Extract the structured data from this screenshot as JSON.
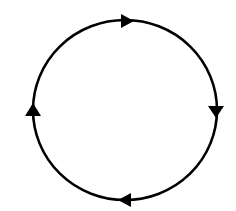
{
  "diagram": {
    "type": "cycle",
    "background": "#ffffff",
    "stroke_color": "#000000",
    "circle": {
      "cx": 125,
      "cy": 110,
      "rx": 92,
      "ry": 90,
      "stroke_width": 2.6
    },
    "direction": "clockwise",
    "arrows": [
      {
        "position": "top",
        "points": "121,14 134,21 121,28",
        "direction": "right"
      },
      {
        "position": "right",
        "points": "208,106 224,106 216,118",
        "direction": "down"
      },
      {
        "position": "bottom",
        "points": "131,193 118,200 131,207",
        "direction": "left"
      },
      {
        "position": "left",
        "points": "25,116 41,116 33,103",
        "direction": "up"
      }
    ]
  }
}
